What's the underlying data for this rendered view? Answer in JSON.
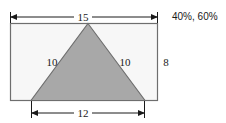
{
  "figure": {
    "name": "rectangle-with-inscribed-triangle",
    "background_color": "#ffffff",
    "rectangle": {
      "fill_color": "#f7f7f7",
      "stroke_color": "#6e6e6e",
      "width_label": "15",
      "height_label": "8"
    },
    "triangle": {
      "fill_color": "#a8a8a8",
      "stroke_color": "#6e6e6e",
      "base_label": "12",
      "left_side_label": "10",
      "right_side_label": "10"
    },
    "dimension_lines": {
      "top": {
        "label": "15",
        "arrow_color": "#1a1a1a"
      },
      "bottom": {
        "label": "12",
        "arrow_color": "#1a1a1a"
      },
      "right": {
        "label": "8"
      }
    },
    "annotation": {
      "text": "40%, 60%",
      "color": "#1a1a1a"
    }
  }
}
